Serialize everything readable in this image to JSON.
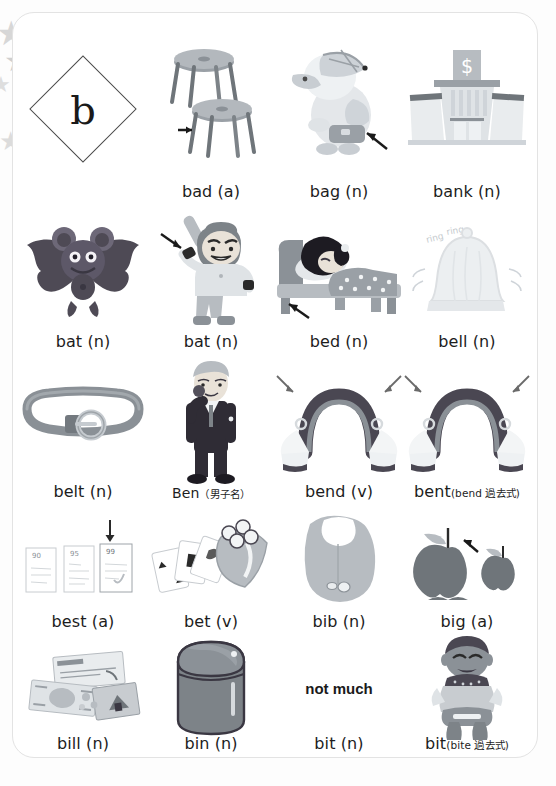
{
  "page": {
    "letter": "b",
    "background_color": "#ffffff",
    "card_border_color": "#e3e3e3",
    "star_color": "#d7d7d7",
    "text_color": "#1d1d1d"
  },
  "stars": [
    {
      "name": "star-1",
      "x": 0,
      "y": 18,
      "size": 30
    },
    {
      "name": "star-2",
      "x": 2,
      "y": 48,
      "size": 26
    },
    {
      "name": "star-3",
      "x": -4,
      "y": 72,
      "size": 18
    },
    {
      "name": "star-4",
      "x": 0,
      "y": 132,
      "size": 22
    }
  ],
  "rows": [
    {
      "index": 1,
      "cells": [
        {
          "name": "letter-diamond",
          "kind": "diamond",
          "label": "",
          "sub": ""
        },
        {
          "name": "entry-bad",
          "kind": "stools",
          "label": "bad (a)",
          "sub": ""
        },
        {
          "name": "entry-bag",
          "kind": "bird",
          "label": "bag (n)",
          "sub": ""
        },
        {
          "name": "entry-bank",
          "kind": "bank",
          "label": "bank (n)",
          "sub": ""
        }
      ]
    },
    {
      "index": 2,
      "cells": [
        {
          "name": "entry-bat-animal",
          "kind": "bat-animal",
          "label": "bat (n)",
          "sub": ""
        },
        {
          "name": "entry-bat-club",
          "kind": "batter",
          "label": "bat (n)",
          "sub": ""
        },
        {
          "name": "entry-bed",
          "kind": "bed",
          "label": "bed (n)",
          "sub": ""
        },
        {
          "name": "entry-bell",
          "kind": "bell",
          "label": "bell (n)",
          "sub": ""
        }
      ]
    },
    {
      "index": 3,
      "cells": [
        {
          "name": "entry-belt",
          "kind": "belt",
          "label": "belt (n)",
          "sub": ""
        },
        {
          "name": "entry-ben",
          "kind": "man",
          "label": "Ben",
          "sub": "（男子名）"
        },
        {
          "name": "entry-bend",
          "kind": "bend",
          "label": "bend (v)",
          "sub": ""
        },
        {
          "name": "entry-bent",
          "kind": "bend",
          "label": "bent",
          "sub": "(bend 過去式)"
        }
      ]
    },
    {
      "index": 4,
      "cells": [
        {
          "name": "entry-best",
          "kind": "tests",
          "label": "best (a)",
          "sub": ""
        },
        {
          "name": "entry-bet",
          "kind": "cards",
          "label": "bet (v)",
          "sub": ""
        },
        {
          "name": "entry-bib",
          "kind": "bib",
          "label": "bib (n)",
          "sub": ""
        },
        {
          "name": "entry-big",
          "kind": "apples",
          "label": "big (a)",
          "sub": ""
        }
      ]
    },
    {
      "index": 5,
      "cells": [
        {
          "name": "entry-bill",
          "kind": "money",
          "label": "bill (n)",
          "sub": ""
        },
        {
          "name": "entry-bin",
          "kind": "bin",
          "label": "bin (n)",
          "sub": ""
        },
        {
          "name": "entry-bit-noun",
          "kind": "not-much",
          "label": "bit (n)",
          "sub": ""
        },
        {
          "name": "entry-bit-past",
          "kind": "biting",
          "label": "bit",
          "sub": "(bite 過去式)"
        }
      ]
    }
  ],
  "annotations": {
    "not_much_text": "not much",
    "bell_sound": "ring ring",
    "test_scores": [
      "90",
      "95",
      "99"
    ],
    "bank_sign": "$"
  }
}
